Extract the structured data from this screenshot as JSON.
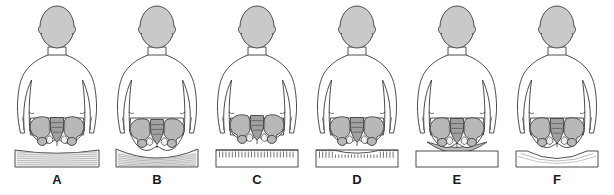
{
  "figure": {
    "background_color": "#ffffff",
    "width": 614,
    "height": 195,
    "palette": {
      "outline": "#3a3a3a",
      "head_fill": "#c9c9c9",
      "body_fill": "#ffffff",
      "pelvis_fill": "#b8b8b8",
      "pelvis_shade": "#a0a0a0",
      "cushion_fill": "#f2f2f2",
      "cushion_line": "#8a8a8a",
      "rigid_fill": "#ffffff",
      "wedge_fill": "#bdbdbd",
      "label_color": "#1a1a1a"
    },
    "panels": [
      {
        "label": "A",
        "seat_type": "soft-compressed-cushion",
        "seat_description": "Soft cushion compressed flat with horizontal compression lines; pelvis level",
        "pelvis_tilt": "level",
        "seat_profile": "slightly-dished"
      },
      {
        "label": "B",
        "seat_type": "soft-sagging-cushion",
        "seat_description": "Over-soft cushion hammocking deeply under the ischial tuberosities",
        "pelvis_tilt": "level-sunken",
        "seat_profile": "deeply-dished"
      },
      {
        "label": "C",
        "seat_type": "rigid-flat-surface",
        "seat_description": "Hard flat board with uniform hatch marks; no contour relief",
        "pelvis_tilt": "level",
        "seat_profile": "flat"
      },
      {
        "label": "D",
        "seat_type": "rigid-contoured-surface",
        "seat_description": "Hard board with shortened hatch marks where the buttocks contact it",
        "pelvis_tilt": "level",
        "seat_profile": "shallow-contoured"
      },
      {
        "label": "E",
        "seat_type": "flat-base-with-wedge",
        "seat_description": "Flat rigid base topped by a grey lens-shaped contoured pad",
        "pelvis_tilt": "level",
        "seat_profile": "convex-pad"
      },
      {
        "label": "F",
        "seat_type": "custom-contoured-seat",
        "seat_description": "Rigid base with a custom-moulded contour matching the buttock curvature",
        "pelvis_tilt": "level",
        "seat_profile": "moulded-contoured"
      }
    ]
  }
}
